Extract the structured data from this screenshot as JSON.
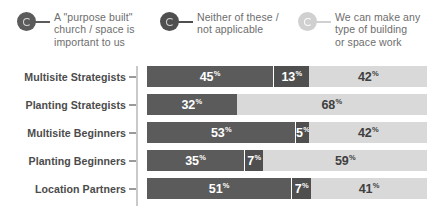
{
  "legend": {
    "items": [
      {
        "label": "A \"purpose built\"\nchurch / space is\nimportant to us",
        "icon": "ring-marker-icon",
        "color": "#5b5b5b"
      },
      {
        "label": "Neither of these /\nnot applicable",
        "icon": "ring-marker-icon",
        "color": "#4f4f4f"
      },
      {
        "label": "We can make any\ntype of building\nor space work",
        "icon": "ring-marker-icon",
        "color": "#d0d0d0"
      }
    ]
  },
  "chart_data": {
    "type": "bar",
    "orientation": "horizontal",
    "stacked": true,
    "percent": true,
    "title": "",
    "subtitle": "",
    "xlabel": "",
    "ylabel": "",
    "xlim": [
      0,
      100
    ],
    "grid": false,
    "legend_position": "top",
    "unit": "%",
    "categories": [
      "Multisite Strategists",
      "Planting Strategists",
      "Multisite Beginners",
      "Planting Beginners",
      "Location Partners"
    ],
    "series": [
      {
        "name": "A \"purpose built\" church / space is important to us",
        "color": "#5b5b5b",
        "values": [
          45,
          32,
          53,
          35,
          51
        ]
      },
      {
        "name": "Neither of these / not applicable",
        "color": "#4f4f4f",
        "values": [
          13,
          0,
          5,
          7,
          7
        ]
      },
      {
        "name": "We can make any type of building or space work",
        "color": "#d9d9d9",
        "values": [
          42,
          68,
          42,
          59,
          41
        ]
      }
    ],
    "rows": [
      {
        "category": "Multisite Strategists",
        "segments": [
          {
            "value": 45,
            "display": "45",
            "unit": "%"
          },
          {
            "value": 13,
            "display": "13",
            "unit": "%"
          },
          {
            "value": 42,
            "display": "42",
            "unit": "%"
          }
        ]
      },
      {
        "category": "Planting Strategists",
        "segments": [
          {
            "value": 32,
            "display": "32",
            "unit": "%"
          },
          {
            "value": 0,
            "display": "",
            "unit": ""
          },
          {
            "value": 68,
            "display": "68",
            "unit": "%"
          }
        ]
      },
      {
        "category": "Multisite Beginners",
        "segments": [
          {
            "value": 53,
            "display": "53",
            "unit": "%"
          },
          {
            "value": 5,
            "display": "5",
            "unit": "%"
          },
          {
            "value": 42,
            "display": "42",
            "unit": "%"
          }
        ]
      },
      {
        "category": "Planting Beginners",
        "segments": [
          {
            "value": 35,
            "display": "35",
            "unit": "%"
          },
          {
            "value": 7,
            "display": "7",
            "unit": "%"
          },
          {
            "value": 59,
            "display": "59",
            "unit": "%"
          }
        ]
      },
      {
        "category": "Location Partners",
        "segments": [
          {
            "value": 51,
            "display": "51",
            "unit": "%"
          },
          {
            "value": 7,
            "display": "7",
            "unit": "%"
          },
          {
            "value": 41,
            "display": "41",
            "unit": "%"
          }
        ]
      }
    ]
  }
}
